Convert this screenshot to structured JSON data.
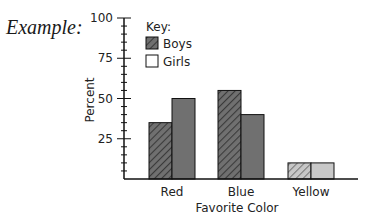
{
  "example_label": "Example:",
  "legend": {
    "title": "Key:",
    "items": [
      {
        "label": "Boys",
        "style": "hatched"
      },
      {
        "label": "Girls",
        "style": "solid"
      }
    ]
  },
  "colors": {
    "axis": "#111111",
    "bar_dark": "#707070",
    "bar_light": "#c8c8c8",
    "hatch_dark": "#3a3a3a",
    "hatch_light": "#7a7a7a",
    "outline": "#111111"
  },
  "chart_data": {
    "type": "bar",
    "title": "",
    "xlabel": "Favorite Color",
    "ylabel": "Percent",
    "ylim": [
      0,
      100
    ],
    "yticks": [
      25,
      50,
      75,
      100
    ],
    "minor_tick_step": 5,
    "categories": [
      "Red",
      "Blue",
      "Yellow"
    ],
    "series": [
      {
        "name": "Boys",
        "values": [
          35,
          55,
          10
        ]
      },
      {
        "name": "Girls",
        "values": [
          50,
          40,
          10
        ]
      }
    ],
    "grid": false,
    "legend_position": "upper-left-inside"
  }
}
